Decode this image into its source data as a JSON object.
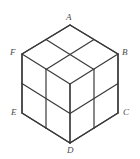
{
  "figure": {
    "type": "isometric-cube-diagram",
    "background_color": "#ffffff",
    "line_color": "#3a3a3a",
    "label_color": "#4a4a4a",
    "stroke_width": 1.2,
    "divisions_per_edge": 2,
    "visible_faces": 3,
    "cells_per_face": 4,
    "vertices": [
      {
        "id": "A",
        "label": "A",
        "role": "top-apex",
        "x": 70,
        "y": 25
      },
      {
        "id": "F",
        "label": "F",
        "role": "upper-left",
        "x": 22,
        "y": 54
      },
      {
        "id": "B",
        "label": "B",
        "role": "upper-right",
        "x": 118,
        "y": 54
      },
      {
        "id": "E",
        "label": "E",
        "role": "lower-left",
        "x": 22,
        "y": 113
      },
      {
        "id": "C",
        "label": "C",
        "role": "lower-right",
        "x": 118,
        "y": 113
      },
      {
        "id": "D",
        "label": "D",
        "role": "bottom-apex",
        "x": 70,
        "y": 143
      },
      {
        "id": "G",
        "label": "",
        "role": "center-front-top",
        "x": 70,
        "y": 84
      }
    ],
    "labels": {
      "A": "A",
      "B": "B",
      "C": "C",
      "D": "D",
      "E": "E",
      "F": "F"
    },
    "outline_path": "M 70 25 L 118 54 L 118 113 L 70 143 L 22 113 L 22 54 Z",
    "top_face_edges": [
      "M 70 25 L 22 54",
      "M 70 25 L 118 54",
      "M 22 54 L 70 84",
      "M 118 54 L 70 84"
    ],
    "top_face_grid": [
      "M 46 39.5 L 94 69.5",
      "M 94 39.5 L 46 69.5"
    ],
    "left_face_edges": [
      "M 22 54 L 22 113",
      "M 70 84 L 70 143",
      "M 22 113 L 70 143"
    ],
    "left_face_grid": [
      "M 46 69.5 L 46 128.5",
      "M 22 83.5 L 70 113.5"
    ],
    "right_face_edges": [
      "M 118 54 L 118 113",
      "M 70 84 L 70 143",
      "M 118 113 L 70 143"
    ],
    "right_face_grid": [
      "M 94 69.5 L 94 128.5",
      "M 118 83.5 L 70 113.5"
    ]
  }
}
